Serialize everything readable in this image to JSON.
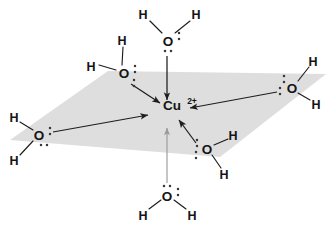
{
  "figure": {
    "background_color": "#ffffff",
    "plane_color": "#dedede",
    "bond_color": "#1d1d1d",
    "faint_arrow_color": "#9a9a9a",
    "dot_color": "#3a3a3a"
  },
  "center": {
    "element": "Cu",
    "charge": "2+",
    "x": 172,
    "y": 110
  },
  "plane": {
    "label": "equatorial-plane",
    "points": "10,140 108,71 326,74 220,157"
  },
  "ligands": [
    {
      "id": "water-top",
      "position": "top",
      "oxygen": {
        "label": "O",
        "x": 168,
        "y": 41
      },
      "hydrogens": [
        {
          "label": "H",
          "x": 143,
          "y": 14
        },
        {
          "label": "H",
          "x": 196,
          "y": 14
        }
      ],
      "bonds": [
        {
          "x1": 150,
          "y1": 21,
          "x2": 162,
          "y2": 33
        },
        {
          "x1": 190,
          "y1": 21,
          "x2": 175,
          "y2": 33
        }
      ],
      "lone_pairs": [
        {
          "x": 179,
          "y": 36,
          "orientation": "vertical"
        },
        {
          "x": 168,
          "y": 51,
          "orientation": "horizontal"
        }
      ],
      "arrow": {
        "x1": 167,
        "y1": 56,
        "x2": 167,
        "y2": 100,
        "faint": false
      }
    },
    {
      "id": "water-upper-left",
      "position": "upper-left",
      "oxygen": {
        "label": "O",
        "x": 124,
        "y": 73
      },
      "hydrogens": [
        {
          "label": "H",
          "x": 122,
          "y": 40
        },
        {
          "label": "H",
          "x": 91,
          "y": 66
        }
      ],
      "bonds": [
        {
          "x1": 123,
          "y1": 47,
          "x2": 122,
          "y2": 65
        },
        {
          "x1": 99,
          "y1": 65,
          "x2": 116,
          "y2": 70
        }
      ],
      "lone_pairs": [
        {
          "x": 135,
          "y": 69,
          "orientation": "vertical"
        },
        {
          "x": 134,
          "y": 83,
          "orientation": "vertical"
        }
      ],
      "arrow": {
        "x1": 131,
        "y1": 84,
        "x2": 160,
        "y2": 103,
        "faint": false
      }
    },
    {
      "id": "water-right",
      "position": "right",
      "oxygen": {
        "label": "O",
        "x": 292,
        "y": 88
      },
      "hydrogens": [
        {
          "label": "H",
          "x": 313,
          "y": 61
        },
        {
          "label": "H",
          "x": 316,
          "y": 104
        }
      ],
      "bonds": [
        {
          "x1": 309,
          "y1": 67,
          "x2": 298,
          "y2": 81
        },
        {
          "x1": 298,
          "y1": 93,
          "x2": 310,
          "y2": 100
        }
      ],
      "lone_pairs": [
        {
          "x": 284,
          "y": 79,
          "orientation": "vertical"
        },
        {
          "x": 280,
          "y": 91,
          "orientation": "vertical"
        }
      ],
      "arrow": {
        "x1": 277,
        "y1": 92,
        "x2": 190,
        "y2": 108,
        "faint": false
      }
    },
    {
      "id": "water-left",
      "position": "left",
      "oxygen": {
        "label": "O",
        "x": 39,
        "y": 135
      },
      "hydrogens": [
        {
          "label": "H",
          "x": 14,
          "y": 117
        },
        {
          "label": "H",
          "x": 14,
          "y": 160
        }
      ],
      "bonds": [
        {
          "x1": 20,
          "y1": 122,
          "x2": 33,
          "y2": 130
        },
        {
          "x1": 20,
          "y1": 155,
          "x2": 33,
          "y2": 141
        }
      ],
      "lone_pairs": [
        {
          "x": 50,
          "y": 131,
          "orientation": "vertical"
        },
        {
          "x": 44,
          "y": 145,
          "orientation": "horizontal"
        }
      ],
      "arrow": {
        "x1": 53,
        "y1": 132,
        "x2": 148,
        "y2": 115,
        "faint": false
      }
    },
    {
      "id": "water-lower-right",
      "position": "lower-right",
      "oxygen": {
        "label": "O",
        "x": 207,
        "y": 149
      },
      "hydrogens": [
        {
          "label": "H",
          "x": 233,
          "y": 135
        },
        {
          "label": "H",
          "x": 224,
          "y": 174
        }
      ],
      "bonds": [
        {
          "x1": 228,
          "y1": 139,
          "x2": 214,
          "y2": 145
        },
        {
          "x1": 212,
          "y1": 155,
          "x2": 221,
          "y2": 168
        }
      ],
      "lone_pairs": [
        {
          "x": 197,
          "y": 143,
          "orientation": "vertical"
        },
        {
          "x": 196,
          "y": 155,
          "orientation": "vertical"
        }
      ],
      "arrow": {
        "x1": 196,
        "y1": 143,
        "x2": 179,
        "y2": 120,
        "faint": false
      }
    },
    {
      "id": "water-bottom",
      "position": "bottom",
      "oxygen": {
        "label": "O",
        "x": 167,
        "y": 196
      },
      "hydrogens": [
        {
          "label": "H",
          "x": 143,
          "y": 215
        },
        {
          "label": "H",
          "x": 192,
          "y": 215
        }
      ],
      "bonds": [
        {
          "x1": 149,
          "y1": 209,
          "x2": 161,
          "y2": 200
        },
        {
          "x1": 186,
          "y1": 209,
          "x2": 174,
          "y2": 200
        }
      ],
      "lone_pairs": [
        {
          "x": 167,
          "y": 186,
          "orientation": "horizontal"
        },
        {
          "x": 178,
          "y": 192,
          "orientation": "vertical"
        }
      ],
      "arrow": {
        "x1": 167,
        "y1": 183,
        "x2": 167,
        "y2": 128,
        "faint": true
      }
    }
  ]
}
